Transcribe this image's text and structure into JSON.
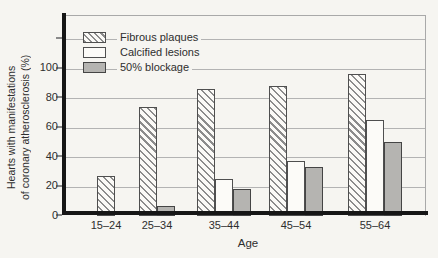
{
  "chart_data": {
    "type": "bar",
    "title": "",
    "xlabel": "Age",
    "ylabel": "Hearts with manifestations of coronary atherosclerosis (%)",
    "ylabel_lines": [
      "Hearts with manifestations",
      "of coronary atherosclerosis (%)"
    ],
    "categories": [
      "15–24",
      "25–34",
      "35–44",
      "45–54",
      "55–64"
    ],
    "series": [
      {
        "name": "Fibrous plaques",
        "style": "hatched",
        "values": [
          27,
          74,
          86,
          88,
          96
        ]
      },
      {
        "name": "Calcified lesions",
        "style": "white",
        "values": [
          0,
          0,
          25,
          37,
          65
        ]
      },
      {
        "name": "50% blockage",
        "style": "gray",
        "values": [
          0,
          7,
          18,
          33,
          50
        ]
      }
    ],
    "y_ticks": [
      0,
      20,
      40,
      60,
      80,
      100
    ],
    "grid_values": [
      20,
      40,
      60,
      80,
      100,
      120
    ],
    "ylim": [
      0,
      135
    ],
    "grid": true,
    "legend_position": "top-left",
    "colors": {
      "gray_fill": "#b5b4b1",
      "hatch_line": "#8c8c8c",
      "bar_outline": "#4f4f4f",
      "gridline": "#b3b3b3",
      "axis": "#161616",
      "background": "#f6f5f1"
    }
  }
}
